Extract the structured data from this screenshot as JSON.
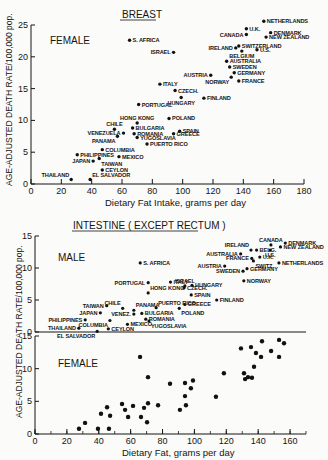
{
  "chart_data": [
    {
      "type": "scatter",
      "title": "BREAST",
      "panel_label": "FEMALE",
      "xlabel": "Dietary Fat Intake, grams per day",
      "ylabel": "AGE-ADJUSTED DEATH RATE/100,000 pop.",
      "xlim": [
        0,
        180
      ],
      "ylim": [
        0,
        25
      ],
      "xticks": [
        0,
        20,
        40,
        60,
        80,
        100,
        120,
        140,
        160,
        180
      ],
      "yticks": [
        0,
        5,
        10,
        15,
        20,
        25
      ],
      "grid": false,
      "points": [
        {
          "label": "NETHERLANDS",
          "x": 153.5,
          "y": 25.6,
          "pos": "r"
        },
        {
          "label": "U.K.",
          "x": 142,
          "y": 24.4,
          "pos": "r"
        },
        {
          "label": "CANADA",
          "x": 142,
          "y": 23.5,
          "pos": "l"
        },
        {
          "label": "DENMARK",
          "x": 158,
          "y": 23.8,
          "pos": "r"
        },
        {
          "label": "NEW ZEALAND",
          "x": 155,
          "y": 23.1,
          "pos": "r"
        },
        {
          "label": "S. AFRICA",
          "x": 65,
          "y": 22.6,
          "pos": "r"
        },
        {
          "label": "ISRAEL",
          "x": 94,
          "y": 20.7,
          "pos": "l"
        },
        {
          "label": "IRELAND",
          "x": 135,
          "y": 21.4,
          "pos": "l"
        },
        {
          "label": "SWITZERLAND",
          "x": 137,
          "y": 21.7,
          "pos": "r"
        },
        {
          "label": "BELGIUM",
          "x": 139,
          "y": 20.9,
          "pos": "b"
        },
        {
          "label": "U.S.",
          "x": 149,
          "y": 21.1,
          "pos": "r"
        },
        {
          "label": "AUSTRALIA",
          "x": 129,
          "y": 19.3,
          "pos": "r"
        },
        {
          "label": "SWEDEN",
          "x": 131,
          "y": 18.4,
          "pos": "r"
        },
        {
          "label": "GERMANY",
          "x": 134,
          "y": 17.5,
          "pos": "r"
        },
        {
          "label": "AUSTRIA",
          "x": 118.5,
          "y": 17.1,
          "pos": "l"
        },
        {
          "label": "NORWAY",
          "x": 132,
          "y": 16.8,
          "pos": "bl"
        },
        {
          "label": "FRANCE",
          "x": 137,
          "y": 16.2,
          "pos": "r"
        },
        {
          "label": "ITALY",
          "x": 85,
          "y": 15.7,
          "pos": "r"
        },
        {
          "label": "CZECH.",
          "x": 95,
          "y": 14.7,
          "pos": "r"
        },
        {
          "label": "HUNGARY",
          "x": 99,
          "y": 13.6,
          "pos": "b"
        },
        {
          "label": "FINLAND",
          "x": 114,
          "y": 13.5,
          "pos": "r"
        },
        {
          "label": "PORTUGAL",
          "x": 71,
          "y": 12.5,
          "pos": "r"
        },
        {
          "label": "POLAND",
          "x": 91,
          "y": 10.3,
          "pos": "r"
        },
        {
          "label": "HONG KONG",
          "x": 70,
          "y": 9.6,
          "pos": "t"
        },
        {
          "label": "CHILE",
          "x": 55,
          "y": 8.6,
          "pos": "t"
        },
        {
          "label": "BULGARIA",
          "x": 67,
          "y": 8.8,
          "pos": "r"
        },
        {
          "label": "VENEZUELA",
          "x": 61,
          "y": 8.0,
          "pos": "l"
        },
        {
          "label": "ROMANIA",
          "x": 68,
          "y": 7.9,
          "pos": "r"
        },
        {
          "label": "SPAIN",
          "x": 98,
          "y": 8.3,
          "pos": "r"
        },
        {
          "label": "GREECE",
          "x": 94,
          "y": 7.9,
          "pos": "r"
        },
        {
          "label": "PANAMA",
          "x": 57,
          "y": 7.5,
          "pos": "bl"
        },
        {
          "label": "YUGOSLAVIA",
          "x": 70,
          "y": 7.3,
          "pos": "r"
        },
        {
          "label": "PUERTO RICO",
          "x": 76.5,
          "y": 6.3,
          "pos": "r"
        },
        {
          "label": "COLUMBIA",
          "x": 47,
          "y": 5.4,
          "pos": "r"
        },
        {
          "label": "PHILIPPINES",
          "x": 30.5,
          "y": 4.6,
          "pos": "r"
        },
        {
          "label": "MEXICO",
          "x": 58,
          "y": 4.3,
          "pos": "r"
        },
        {
          "label": "JAPAN",
          "x": 41,
          "y": 3.6,
          "pos": "l"
        },
        {
          "label": "TAIWAN",
          "x": 45,
          "y": 4.0,
          "pos": "br"
        },
        {
          "label": "CEYLON",
          "x": 47,
          "y": 2.2,
          "pos": "r"
        },
        {
          "label": "THAILAND",
          "x": 26.5,
          "y": 0.7,
          "pos": "tl"
        },
        {
          "label": "EL SALVADOR",
          "x": 39,
          "y": 0.7,
          "pos": "tr"
        }
      ]
    },
    {
      "type": "scatter",
      "title": "INTESTINE ( EXCEPT RECTUM )",
      "panel_label": "MALE",
      "xlabel": "Dietary Fat, grams per day",
      "ylabel": "AGE-ADJUSTED DEATH RATE/100,000 pop.",
      "xlim": [
        0,
        170
      ],
      "ylim": [
        0,
        15
      ],
      "xticks": [
        0,
        20,
        40,
        60,
        80,
        100,
        120,
        140,
        160
      ],
      "yticks": [
        0,
        5,
        10,
        15
      ],
      "grid": false,
      "points": [
        {
          "label": "CANADA",
          "x": 148,
          "y": 13.6,
          "pos": "t"
        },
        {
          "label": "DENMARK",
          "x": 157,
          "y": 13.9,
          "pos": "r"
        },
        {
          "label": "NEW ZEALAND",
          "x": 154,
          "y": 13.3,
          "pos": "r"
        },
        {
          "label": "IRELAND",
          "x": 135.5,
          "y": 12.8,
          "pos": "tl"
        },
        {
          "label": "BELG.",
          "x": 139,
          "y": 12.8,
          "pos": "r"
        },
        {
          "label": "U.S.",
          "x": 147.5,
          "y": 12.8,
          "pos": "b"
        },
        {
          "label": "AUSTRALIA",
          "x": 129,
          "y": 12.2,
          "pos": "l"
        },
        {
          "label": "U.K.",
          "x": 141,
          "y": 11.7,
          "pos": "r"
        },
        {
          "label": "FRANCE",
          "x": 136,
          "y": 11.5,
          "pos": "l"
        },
        {
          "label": "SWITZ.",
          "x": 137,
          "y": 11.1,
          "pos": "br"
        },
        {
          "label": "S. AFRICA",
          "x": 66,
          "y": 10.8,
          "pos": "r"
        },
        {
          "label": "NETHERLANDS",
          "x": 153,
          "y": 10.8,
          "pos": "r"
        },
        {
          "label": "AUSTRIA",
          "x": 119,
          "y": 10.3,
          "pos": "l"
        },
        {
          "label": "GERMANY",
          "x": 133,
          "y": 9.9,
          "pos": "r"
        },
        {
          "label": "SWEDEN",
          "x": 130.5,
          "y": 9.5,
          "pos": "l"
        },
        {
          "label": "NORWAY",
          "x": 131,
          "y": 8.0,
          "pos": "r"
        },
        {
          "label": "ITALY",
          "x": 85,
          "y": 7.8,
          "pos": "r"
        },
        {
          "label": "PORTUGAL",
          "x": 71,
          "y": 7.7,
          "pos": "l"
        },
        {
          "label": "ISRAEL",
          "x": 94,
          "y": 7.2,
          "pos": "t"
        },
        {
          "label": "HUNGARY",
          "x": 98.5,
          "y": 7.3,
          "pos": "r"
        },
        {
          "label": "CZECH.",
          "x": 93.5,
          "y": 6.9,
          "pos": "r"
        },
        {
          "label": "HONG KONG",
          "x": 71,
          "y": 6.1,
          "pos": "tr"
        },
        {
          "label": "SPAIN",
          "x": 98,
          "y": 5.8,
          "pos": "r"
        },
        {
          "label": "FINLAND",
          "x": 114,
          "y": 5.0,
          "pos": "r"
        },
        {
          "label": "GREECE",
          "x": 94,
          "y": 4.3,
          "pos": "r"
        },
        {
          "label": "TAIWAN",
          "x": 45,
          "y": 4.1,
          "pos": "l"
        },
        {
          "label": "PUERTO RICO",
          "x": 76,
          "y": 3.8,
          "pos": "tr"
        },
        {
          "label": "POLAND",
          "x": 90.5,
          "y": 3.7,
          "pos": "br"
        },
        {
          "label": "CHILE",
          "x": 55,
          "y": 3.7,
          "pos": "tl"
        },
        {
          "label": "PANAMA",
          "x": 62,
          "y": 3.4,
          "pos": "tr"
        },
        {
          "label": "JAPAN",
          "x": 41,
          "y": 3.0,
          "pos": "l"
        },
        {
          "label": "VENEZ.",
          "x": 62,
          "y": 2.8,
          "pos": "l"
        },
        {
          "label": "BULGARIA",
          "x": 67,
          "y": 2.9,
          "pos": "r"
        },
        {
          "label": "ROMANIA",
          "x": 69.5,
          "y": 2.0,
          "pos": "r"
        },
        {
          "label": "PHILIPPINES",
          "x": 31.5,
          "y": 1.9,
          "pos": "l"
        },
        {
          "label": "COLUMBIA",
          "x": 47,
          "y": 1.8,
          "pos": "bl"
        },
        {
          "label": "MEXICO",
          "x": 58,
          "y": 1.2,
          "pos": "r"
        },
        {
          "label": "YUGOSLAVIA",
          "x": 71.5,
          "y": 1.7,
          "pos": "br"
        },
        {
          "label": "THAILAND",
          "x": 27.5,
          "y": 0.6,
          "pos": "l"
        },
        {
          "label": "CEYLON",
          "x": 46,
          "y": 0.5,
          "pos": "r"
        },
        {
          "label": "EL SALVADOR",
          "x": 39,
          "y": 0.1,
          "pos": "bl"
        }
      ]
    },
    {
      "type": "scatter",
      "title": "INTESTINE ( EXCEPT RECTUM )",
      "panel_label": "FEMALE",
      "xlabel": "Dietary Fat, grams per day",
      "ylabel": "AGE-ADJUSTED DEATH RATE/100,000 pop.",
      "xlim": [
        0,
        170
      ],
      "ylim": [
        0,
        15
      ],
      "xticks": [
        0,
        20,
        40,
        60,
        80,
        100,
        120,
        140,
        160
      ],
      "yticks": [
        0,
        5,
        10,
        15
      ],
      "grid": false,
      "points": [
        {
          "x": 27.6,
          "y": 0.8
        },
        {
          "x": 31.4,
          "y": 1.7
        },
        {
          "x": 39.5,
          "y": 0.8
        },
        {
          "x": 46.4,
          "y": 0.8
        },
        {
          "x": 41.4,
          "y": 3.1
        },
        {
          "x": 45.2,
          "y": 4.1
        },
        {
          "x": 47.1,
          "y": 2.8
        },
        {
          "x": 54.6,
          "y": 4.6
        },
        {
          "x": 56.5,
          "y": 3.7
        },
        {
          "x": 58.4,
          "y": 2.6
        },
        {
          "x": 61.5,
          "y": 4.3
        },
        {
          "x": 65.9,
          "y": 11.8
        },
        {
          "x": 66.5,
          "y": 2.6
        },
        {
          "x": 68.4,
          "y": 4.0
        },
        {
          "x": 70.3,
          "y": 1.8
        },
        {
          "x": 70.9,
          "y": 4.7
        },
        {
          "x": 70.9,
          "y": 8.7
        },
        {
          "x": 77.2,
          "y": 4.4
        },
        {
          "x": 84.7,
          "y": 7.7
        },
        {
          "x": 90.9,
          "y": 3.7
        },
        {
          "x": 94.1,
          "y": 7.8
        },
        {
          "x": 94.1,
          "y": 5.8
        },
        {
          "x": 94.7,
          "y": 4.4
        },
        {
          "x": 97.8,
          "y": 7.0
        },
        {
          "x": 99.1,
          "y": 8.2
        },
        {
          "x": 113.5,
          "y": 5.7
        },
        {
          "x": 118.5,
          "y": 9.3
        },
        {
          "x": 129.2,
          "y": 13.1
        },
        {
          "x": 131.1,
          "y": 9.3
        },
        {
          "x": 131.8,
          "y": 8.4
        },
        {
          "x": 133.6,
          "y": 8.7
        },
        {
          "x": 136.1,
          "y": 8.6
        },
        {
          "x": 135.5,
          "y": 13.3
        },
        {
          "x": 137.4,
          "y": 10.3
        },
        {
          "x": 138.6,
          "y": 12.4
        },
        {
          "x": 141.8,
          "y": 11.8
        },
        {
          "x": 142.4,
          "y": 14.2
        },
        {
          "x": 148.1,
          "y": 12.7
        },
        {
          "x": 153.1,
          "y": 14.4
        },
        {
          "x": 153.1,
          "y": 11.8
        },
        {
          "x": 156.2,
          "y": 13.9
        }
      ]
    }
  ]
}
